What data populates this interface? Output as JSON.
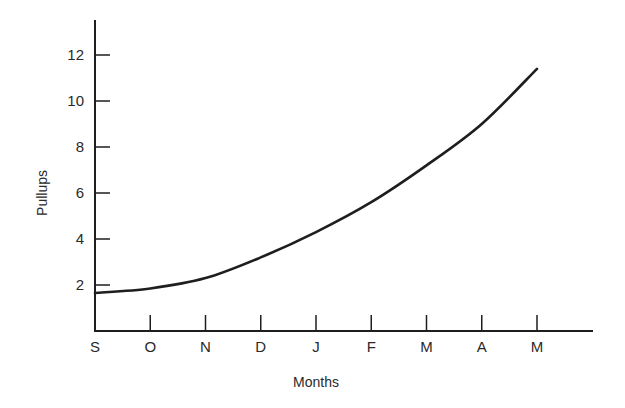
{
  "chart_data": {
    "type": "line",
    "title": "",
    "xlabel": "Months",
    "ylabel": "Pullups",
    "categories": [
      "S",
      "O",
      "N",
      "D",
      "J",
      "F",
      "M",
      "A",
      "M"
    ],
    "x": [
      "S",
      "O",
      "N",
      "D",
      "J",
      "F",
      "M",
      "A",
      "M"
    ],
    "series": [
      {
        "name": "Pullups",
        "values": [
          1.65,
          1.85,
          2.3,
          3.2,
          4.3,
          5.6,
          7.2,
          9.0,
          11.4
        ]
      }
    ],
    "y_ticks": [
      2,
      4,
      6,
      8,
      10,
      12
    ],
    "ylim": [
      0,
      13.5
    ],
    "grid": false,
    "legend": "none",
    "line_color": "#1e1e1e"
  },
  "axes": {
    "x_label": "Months",
    "y_label": "Pullups"
  }
}
